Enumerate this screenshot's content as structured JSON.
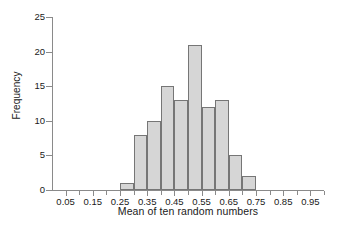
{
  "chart_data": {
    "type": "bar",
    "subtype": "histogram",
    "title": "",
    "xlabel": "Mean of ten random numbers",
    "ylabel": "Frequency",
    "xlim": [
      0.0,
      1.0
    ],
    "ylim": [
      0,
      25
    ],
    "grid": false,
    "legend": null,
    "bin_width": 0.05,
    "bin_edges": [
      0.25,
      0.3,
      0.35,
      0.4,
      0.45,
      0.5,
      0.55,
      0.6,
      0.65,
      0.7,
      0.75
    ],
    "categories": [
      "0.25-0.30",
      "0.30-0.35",
      "0.35-0.40",
      "0.40-0.45",
      "0.45-0.50",
      "0.50-0.55",
      "0.55-0.60",
      "0.60-0.65",
      "0.65-0.70",
      "0.70-0.75"
    ],
    "values": [
      1,
      8,
      10,
      15,
      13,
      21,
      12,
      13,
      5,
      2
    ],
    "bars": [
      {
        "left": 0.25,
        "right": 0.3,
        "value": 1
      },
      {
        "left": 0.3,
        "right": 0.35,
        "value": 8
      },
      {
        "left": 0.35,
        "right": 0.4,
        "value": 10
      },
      {
        "left": 0.4,
        "right": 0.45,
        "value": 15
      },
      {
        "left": 0.45,
        "right": 0.5,
        "value": 13
      },
      {
        "left": 0.5,
        "right": 0.55,
        "value": 21
      },
      {
        "left": 0.55,
        "right": 0.6,
        "value": 12
      },
      {
        "left": 0.6,
        "right": 0.65,
        "value": 13
      },
      {
        "left": 0.65,
        "right": 0.7,
        "value": 5
      },
      {
        "left": 0.7,
        "right": 0.75,
        "value": 2
      }
    ],
    "x_ticks": [
      0.05,
      0.15,
      0.25,
      0.35,
      0.45,
      0.55,
      0.65,
      0.75,
      0.85,
      0.95
    ],
    "x_tick_labels": [
      "0.05",
      "0.15",
      "0.25",
      "0.35",
      "0.45",
      "0.55",
      "0.65",
      "0.75",
      "0.85",
      "0.95"
    ],
    "x_minor_ticks": [
      0.1,
      0.2,
      0.3,
      0.4,
      0.5,
      0.6,
      0.7,
      0.8,
      0.9,
      1.0
    ],
    "y_ticks": [
      0,
      5,
      10,
      15,
      20,
      25
    ],
    "y_tick_labels": [
      "0",
      "5",
      "10",
      "15",
      "20",
      "25"
    ],
    "colors": {
      "bar_fill": "#d6d6d6",
      "bar_edge": "#767676",
      "axis": "#8a8a8a",
      "text": "#1a1a1a",
      "background": "#ffffff"
    }
  }
}
